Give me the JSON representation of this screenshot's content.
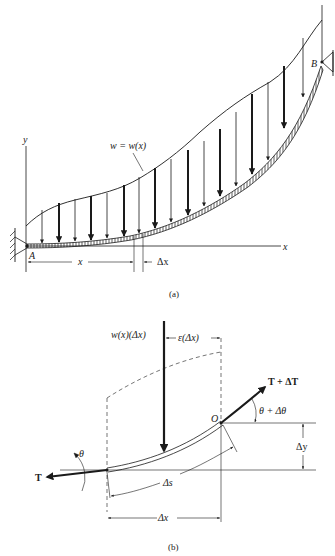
{
  "figure_a": {
    "caption": "(a)",
    "axis_y_label": "y",
    "axis_x_label": "x",
    "load_label": "w = w(x)",
    "support_left_label": "A",
    "support_right_label": "B",
    "dim_x_label": "x",
    "dim_dx_label": "Δx"
  },
  "figure_b": {
    "caption": "(b)",
    "load_label": "w(x)(Δx)",
    "eps_label": "ε(Δx)",
    "point_o_label": "O",
    "tension_right_label": "T + ΔT",
    "angle_right_label": "θ + Δθ",
    "tension_left_label": "T",
    "angle_left_label": "θ",
    "dy_label": "Δy",
    "ds_label": "Δs",
    "dx_label": "Δx"
  },
  "colors": {
    "ink": "#1a1a1a",
    "background": "#ffffff"
  }
}
